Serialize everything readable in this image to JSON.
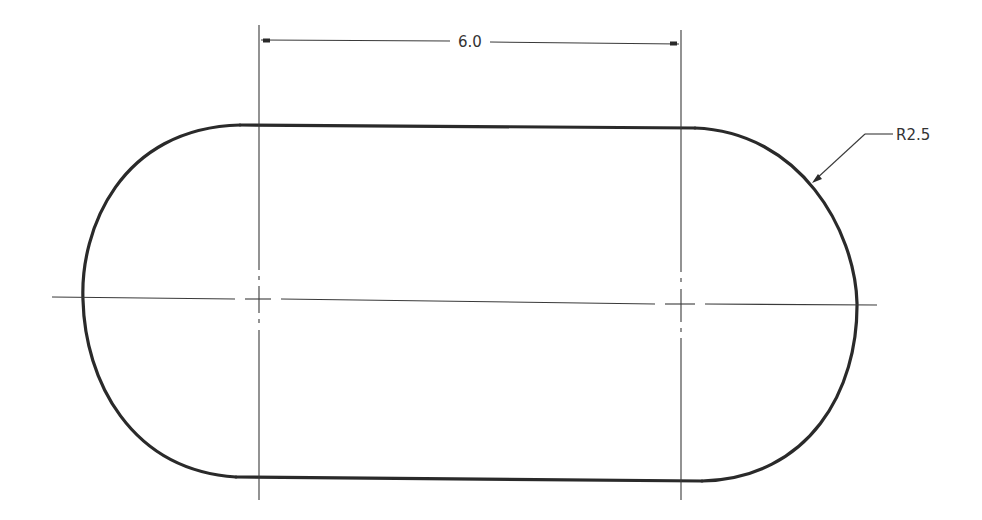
{
  "drawing": {
    "type": "slot / obround technical drawing",
    "line_color": "#2a2a2a",
    "background": "#ffffff"
  },
  "dimensions": {
    "center_distance": {
      "label": "6.0"
    },
    "radius": {
      "label": "R2.5"
    }
  }
}
